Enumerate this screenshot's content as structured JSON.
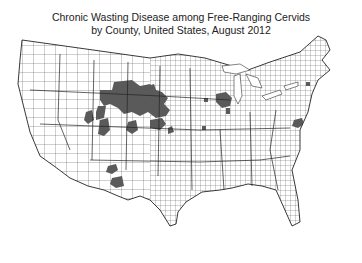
{
  "title": {
    "line1": "Chronic Wasting Disease among Free-Ranging Cervids",
    "line2": "by County, United States, August 2012"
  },
  "map": {
    "type": "choropleth",
    "region": "Contiguous United States",
    "unit": "County",
    "fill_color_affected": "#5a5a5a",
    "fill_color_unaffected": "#ffffff",
    "border_color": "#333333",
    "affected_regions": [
      "Wyoming (southeast)",
      "Colorado (northeast/central)",
      "Nebraska (west)",
      "South Dakota (southwest)",
      "Kansas (northwest)",
      "Utah (central/east)",
      "New Mexico (south)",
      "Wisconsin (south-central)",
      "Illinois (north)",
      "Minnesota (southeast)",
      "West Virginia / Virginia (Appalachian)",
      "New York (central)"
    ]
  }
}
